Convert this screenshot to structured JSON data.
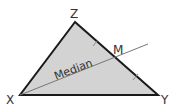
{
  "diagram": {
    "vertices": {
      "top": "Z",
      "left": "X",
      "right": "Y",
      "midpoint": "M"
    },
    "median_label": "Median",
    "colors": {
      "fill": "#d3d3d3",
      "stroke": "#1a1a1a",
      "median_line": "#777777"
    }
  }
}
